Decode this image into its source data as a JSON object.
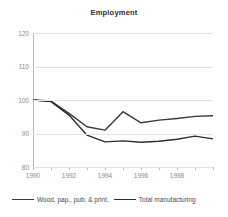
{
  "chart_data": {
    "type": "line",
    "title": "Employment",
    "xlabel": "",
    "ylabel": "",
    "x": [
      1990,
      1991,
      1992,
      1993,
      1994,
      1995,
      1996,
      1997,
      1998,
      1999,
      2000
    ],
    "categories": [
      "1990",
      "1991",
      "1992",
      "1993",
      "1994",
      "1995",
      "1996",
      "1997",
      "1998",
      "1999",
      "2000"
    ],
    "xtick_labels": [
      "1990",
      "1992",
      "1994",
      "1996",
      "1998"
    ],
    "xtick_values": [
      1990,
      1992,
      1994,
      1996,
      1998
    ],
    "ytick_labels": [
      "80",
      "90",
      "100",
      "110",
      "120"
    ],
    "ytick_values": [
      80,
      90,
      100,
      110,
      120
    ],
    "ylim": [
      80,
      120
    ],
    "xlim": [
      1990,
      2000
    ],
    "grid": true,
    "grid_axis": "y",
    "legend_position": "bottom",
    "series": [
      {
        "name": "Wood, pap., pub. & print.",
        "color": "#3a3a3a",
        "values": [
          100,
          99.7,
          96.0,
          92.0,
          91.0,
          96.5,
          93.2,
          94.0,
          94.5,
          95.1,
          95.3
        ]
      },
      {
        "name": "Total manufacturing",
        "color": "#2e2e2e",
        "values": [
          100,
          99.5,
          95.5,
          89.5,
          87.5,
          87.8,
          87.4,
          87.7,
          88.3,
          89.2,
          88.4
        ]
      }
    ]
  },
  "legend": {
    "items": [
      {
        "label": "Wood, pap., pub. & print."
      },
      {
        "label": "Total manufacturing"
      }
    ]
  },
  "colors": {
    "series_primary": "#3a3a3a",
    "series_secondary": "#2e2e2e",
    "gridline": "#e2e2e2",
    "axis": "#b9b9b9",
    "tick_text": "#8a8a8a",
    "title_text": "#2b2b2b",
    "background": "#ffffff"
  }
}
